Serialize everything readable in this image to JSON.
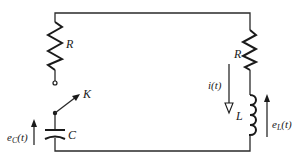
{
  "diagram": {
    "type": "circuit",
    "components": {
      "left_resistor": {
        "label": "R"
      },
      "switch": {
        "label": "K"
      },
      "capacitor": {
        "label": "C"
      },
      "right_resistor": {
        "label": "R"
      },
      "inductor": {
        "label": "L"
      }
    },
    "annotations": {
      "capacitor_voltage": "e",
      "capacitor_voltage_sub": "C",
      "capacitor_voltage_arg": "(t)",
      "current": "i(t)",
      "inductor_voltage": "e",
      "inductor_voltage_sub": "L",
      "inductor_voltage_arg": "(t)"
    },
    "colors": {
      "line": "#1a1a1a",
      "background": "#ffffff"
    }
  }
}
